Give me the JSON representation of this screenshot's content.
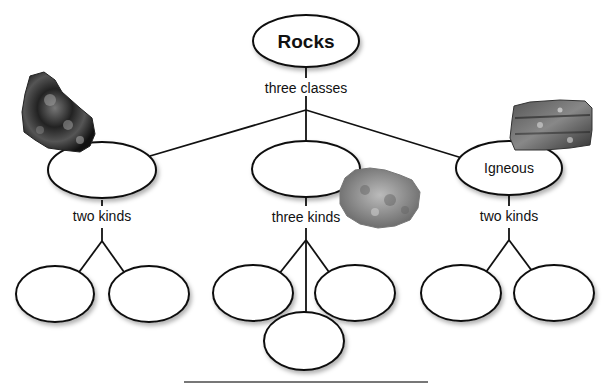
{
  "diagram": {
    "root": {
      "label": "Rocks"
    },
    "root_link_label": "three classes",
    "classes": [
      {
        "id": "class-1",
        "label": "",
        "link_label": "two kinds",
        "children": [
          "",
          ""
        ],
        "image": "dark-rock-image"
      },
      {
        "id": "class-2",
        "label": "",
        "link_label": "three kinds",
        "children": [
          "",
          "",
          ""
        ],
        "image": "light-porous-rock-image"
      },
      {
        "id": "class-3",
        "label": "Igneous",
        "link_label": "two kinds",
        "children": [
          "",
          ""
        ],
        "image": "granite-rock-image"
      }
    ]
  },
  "colors": {
    "stroke": "#111111",
    "background": "#ffffff",
    "shadow": "#bbbbbb"
  }
}
